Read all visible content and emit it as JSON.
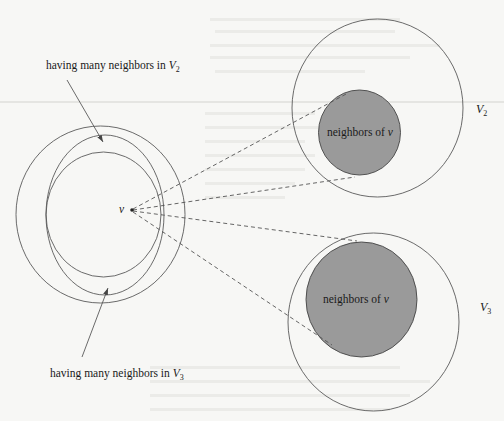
{
  "diagram": {
    "vertex_label": "v",
    "label_top": {
      "text": "having many neighbors in ",
      "var": "V",
      "sub": "2"
    },
    "label_bottom": {
      "text": "having many neighbors in ",
      "var": "V",
      "sub": "3"
    },
    "set_v2": {
      "var": "V",
      "sub": "2",
      "inner_label": "neighbors of ",
      "inner_var": "v"
    },
    "set_v3": {
      "var": "V",
      "sub": "3",
      "inner_label": "neighbors of ",
      "inner_var": "v"
    },
    "colors": {
      "shaded_fill": "#9a9a9a",
      "outline": "#5a5a5a",
      "background": "#f7f7f5"
    }
  }
}
